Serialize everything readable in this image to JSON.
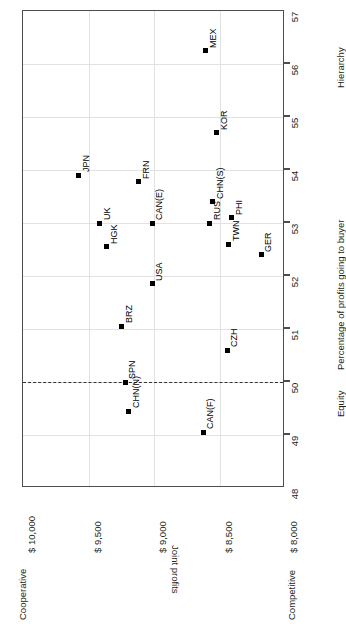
{
  "chart_data": {
    "type": "scatter",
    "title": "",
    "xlabel": "Joint profits",
    "ylabel": "Percentage of profits going to buyer",
    "xlim": [
      8000,
      10000
    ],
    "ylim": [
      48,
      57
    ],
    "grid": true,
    "legend": null,
    "orientation": "rotated-90-ccw",
    "x_tick_labels": [
      "$ 10,000",
      "$ 9,500",
      "$ 9,000",
      "$ 8,500",
      "$ 8,000"
    ],
    "x_tick_values": [
      10000,
      9500,
      9000,
      8500,
      8000
    ],
    "y_tick_labels": [
      "57",
      "56",
      "55",
      "54",
      "53",
      "52",
      "51",
      "50",
      "49",
      "48"
    ],
    "y_tick_values": [
      57,
      56,
      55,
      54,
      53,
      52,
      51,
      50,
      49,
      48
    ],
    "annotations": {
      "x_axis_low_end": "Competitive",
      "x_axis_high_end": "Cooperative",
      "y_axis_low_end": "Equity",
      "y_axis_high_end": "Hierarchy",
      "reference_line": {
        "axis": "y",
        "value": 50,
        "style": "dashed",
        "label": "Equity"
      }
    },
    "points": [
      {
        "label": "JPN",
        "joint_profits": 9575,
        "pct_to_buyer": 53.9
      },
      {
        "label": "UK",
        "joint_profits": 9415,
        "pct_to_buyer": 53.0
      },
      {
        "label": "HGK",
        "joint_profits": 9360,
        "pct_to_buyer": 52.55
      },
      {
        "label": "FRN",
        "joint_profits": 9115,
        "pct_to_buyer": 53.78
      },
      {
        "label": "CAN(E)",
        "joint_profits": 9015,
        "pct_to_buyer": 53.0
      },
      {
        "label": "USA",
        "joint_profits": 9015,
        "pct_to_buyer": 51.85
      },
      {
        "label": "BRZ",
        "joint_profits": 9245,
        "pct_to_buyer": 51.05
      },
      {
        "label": "SPN",
        "joint_profits": 9220,
        "pct_to_buyer": 50.0
      },
      {
        "label": "CHN(N)",
        "joint_profits": 9195,
        "pct_to_buyer": 49.45
      },
      {
        "label": "MEX",
        "joint_profits": 8605,
        "pct_to_buyer": 56.25
      },
      {
        "label": "KOR",
        "joint_profits": 8520,
        "pct_to_buyer": 54.7
      },
      {
        "label": "CHN(S)",
        "joint_profits": 8550,
        "pct_to_buyer": 53.4
      },
      {
        "label": "RUS",
        "joint_profits": 8575,
        "pct_to_buyer": 53.0
      },
      {
        "label": "PHI",
        "joint_profits": 8405,
        "pct_to_buyer": 53.1
      },
      {
        "label": "TWN",
        "joint_profits": 8430,
        "pct_to_buyer": 52.6
      },
      {
        "label": "GER",
        "joint_profits": 8180,
        "pct_to_buyer": 52.4
      },
      {
        "label": "CZH",
        "joint_profits": 8440,
        "pct_to_buyer": 50.6
      },
      {
        "label": "CAN(F)",
        "joint_profits": 8625,
        "pct_to_buyer": 49.05
      }
    ]
  }
}
